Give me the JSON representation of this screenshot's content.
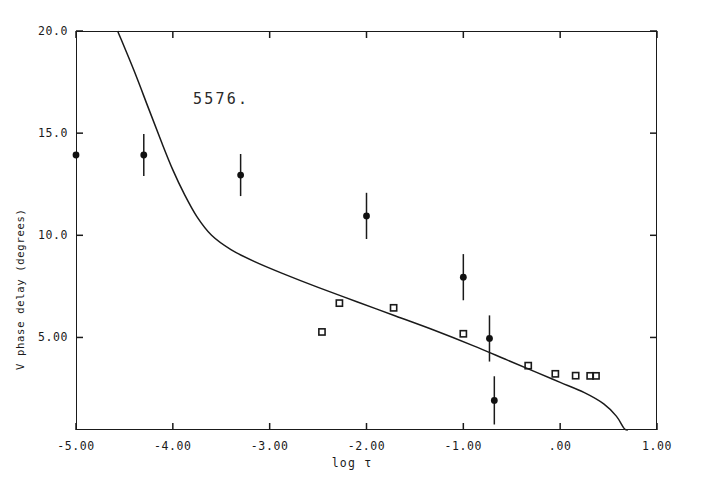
{
  "chart_data": {
    "type": "scatter",
    "title": "",
    "annotation": "5576.",
    "xlabel": "log τ",
    "ylabel": "V phase delay (degrees)",
    "xlim": [
      -5.0,
      1.0
    ],
    "ylim": [
      0.47,
      20.0
    ],
    "grid": false,
    "legend": "none",
    "xticks": [
      -5.0,
      -4.0,
      -3.0,
      -2.0,
      -1.0,
      0.0,
      1.0
    ],
    "xtick_labels": [
      "-5.00",
      "-4.00",
      "-3.00",
      "-2.00",
      "-1.00",
      ".00",
      "1.00"
    ],
    "yticks": [
      5.0,
      10.0,
      15.0,
      20.0
    ],
    "ytick_labels": [
      "5.00",
      "10.0",
      "15.0",
      "20.0"
    ],
    "series": [
      {
        "name": "observed",
        "marker": "filled-circle-with-errorbar",
        "points": [
          {
            "x": -5.0,
            "y": 13.93,
            "yerr": 0.0
          },
          {
            "x": -4.3,
            "y": 13.93,
            "yerr": 1.03
          },
          {
            "x": -3.3,
            "y": 12.95,
            "yerr": 1.03
          },
          {
            "x": -2.0,
            "y": 10.95,
            "yerr": 1.13
          },
          {
            "x": -1.0,
            "y": 7.95,
            "yerr": 1.13
          },
          {
            "x": -0.73,
            "y": 4.95,
            "yerr": 1.13
          },
          {
            "x": -0.68,
            "y": 1.92,
            "yerr": 1.18
          }
        ]
      },
      {
        "name": "model-points",
        "marker": "open-square",
        "points": [
          {
            "x": -2.46,
            "y": 5.27
          },
          {
            "x": -2.28,
            "y": 6.68
          },
          {
            "x": -1.72,
            "y": 6.45
          },
          {
            "x": -1.0,
            "y": 5.18
          },
          {
            "x": -0.33,
            "y": 3.62
          },
          {
            "x": -0.05,
            "y": 3.22
          },
          {
            "x": 0.16,
            "y": 3.13
          },
          {
            "x": 0.31,
            "y": 3.12
          },
          {
            "x": 0.37,
            "y": 3.12
          }
        ]
      },
      {
        "name": "model-curve",
        "marker": "line",
        "points": [
          {
            "x": -4.57,
            "y": 20.0
          },
          {
            "x": -4.4,
            "y": 18.05
          },
          {
            "x": -4.25,
            "y": 16.2
          },
          {
            "x": -4.12,
            "y": 14.6
          },
          {
            "x": -4.0,
            "y": 13.2
          },
          {
            "x": -3.88,
            "y": 12.0
          },
          {
            "x": -3.75,
            "y": 10.9
          },
          {
            "x": -3.6,
            "y": 10.0
          },
          {
            "x": -3.4,
            "y": 9.3
          },
          {
            "x": -3.15,
            "y": 8.7
          },
          {
            "x": -2.85,
            "y": 8.1
          },
          {
            "x": -2.5,
            "y": 7.45
          },
          {
            "x": -2.1,
            "y": 6.75
          },
          {
            "x": -1.7,
            "y": 6.05
          },
          {
            "x": -1.3,
            "y": 5.35
          },
          {
            "x": -0.9,
            "y": 4.6
          },
          {
            "x": -0.55,
            "y": 3.9
          },
          {
            "x": -0.25,
            "y": 3.3
          },
          {
            "x": 0.0,
            "y": 2.8
          },
          {
            "x": 0.25,
            "y": 2.3
          },
          {
            "x": 0.45,
            "y": 1.75
          },
          {
            "x": 0.58,
            "y": 1.15
          },
          {
            "x": 0.66,
            "y": 0.55
          },
          {
            "x": 0.7,
            "y": 0.47
          }
        ]
      }
    ]
  },
  "axes": {
    "frame": {
      "left": 76,
      "top": 31,
      "width": 581,
      "height": 399
    }
  }
}
